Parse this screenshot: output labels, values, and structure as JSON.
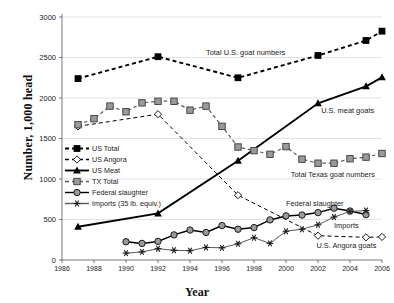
{
  "chart_data": {
    "type": "line",
    "title": "",
    "xlabel": "Year",
    "ylabel": "Number, 1,000 head",
    "xlim": [
      1986,
      2006
    ],
    "ylim": [
      0,
      3000
    ],
    "xticks": [
      1986,
      1988,
      1990,
      1992,
      1994,
      1996,
      1998,
      2000,
      2002,
      2004,
      2006
    ],
    "yticks": [
      0,
      500,
      1000,
      1500,
      2000,
      2500,
      3000
    ],
    "grid": "horizontal",
    "legend_position": "inner-left",
    "series": [
      {
        "name": "US Total",
        "marker": "filled-square",
        "color": "#000000",
        "linestyle": "dashed",
        "x": [
          1987,
          1992,
          1997,
          2002,
          2005,
          2006
        ],
        "values": [
          2240,
          2510,
          2250,
          2525,
          2710,
          2825
        ]
      },
      {
        "name": "US Angora",
        "marker": "open-diamond",
        "color": "#000000",
        "linestyle": "dashed",
        "x": [
          1987,
          1992,
          1997,
          2002,
          2005,
          2006
        ],
        "values": [
          1650,
          1800,
          800,
          300,
          280,
          285
        ]
      },
      {
        "name": "US Meat",
        "marker": "filled-triangle",
        "color": "#000000",
        "linestyle": "solid",
        "x": [
          1987,
          1992,
          1997,
          2002,
          2005,
          2006
        ],
        "values": [
          410,
          575,
          1225,
          1935,
          2145,
          2255
        ]
      },
      {
        "name": "TX Total",
        "marker": "gray-square",
        "color": "#8c8c8c",
        "linestyle": "dashed",
        "x": [
          1987,
          1988,
          1989,
          1990,
          1991,
          1992,
          1993,
          1994,
          1995,
          1996,
          1997,
          1998,
          1999,
          2000,
          2001,
          2002,
          2003,
          2004,
          2005,
          2006
        ],
        "values": [
          1670,
          1745,
          1900,
          1830,
          1940,
          1960,
          1960,
          1850,
          1900,
          1650,
          1395,
          1350,
          1305,
          1400,
          1245,
          1195,
          1195,
          1250,
          1270,
          1315
        ]
      },
      {
        "name": "Federal slaughter",
        "marker": "gray-circle",
        "color": "#000000",
        "linestyle": "solid",
        "x": [
          1990,
          1991,
          1992,
          1993,
          1994,
          1995,
          1996,
          1997,
          1998,
          1999,
          2000,
          2001,
          2002,
          2003,
          2004,
          2005
        ],
        "values": [
          225,
          205,
          230,
          310,
          370,
          340,
          425,
          380,
          400,
          495,
          545,
          555,
          585,
          640,
          605,
          560
        ]
      },
      {
        "name": "Imports (35 lb. equiv.)",
        "marker": "asterisk",
        "color": "#4d4d4d",
        "linestyle": "solid",
        "x": [
          1990,
          1991,
          1992,
          1993,
          1994,
          1995,
          1996,
          1997,
          1998,
          1999,
          2000,
          2001,
          2002,
          2003,
          2004,
          2005
        ],
        "values": [
          85,
          100,
          140,
          120,
          115,
          155,
          150,
          200,
          275,
          205,
          355,
          380,
          435,
          530,
          600,
          610
        ]
      }
    ],
    "annotations": [
      {
        "text": "Total U.S. goat numbers",
        "x": 1995.0,
        "y": 2560
      },
      {
        "text": "U.S. meat goats",
        "x": 2002.2,
        "y": 1840
      },
      {
        "text": "Total Texas goat numbers",
        "x": 2000.3,
        "y": 1055
      },
      {
        "text": "Federal slaughter",
        "x": 2000.0,
        "y": 690
      },
      {
        "text": "Imports",
        "x": 2003.0,
        "y": 425
      },
      {
        "text": "U.S. Angora goats",
        "x": 2001.9,
        "y": 170
      }
    ]
  },
  "legend": {
    "items": [
      {
        "label": "US Total"
      },
      {
        "label": "US Angora"
      },
      {
        "label": "US Meat"
      },
      {
        "label": "TX Total"
      },
      {
        "label": "Federal slaughter"
      },
      {
        "label": "Imports (35 lb. equiv.)"
      }
    ]
  }
}
